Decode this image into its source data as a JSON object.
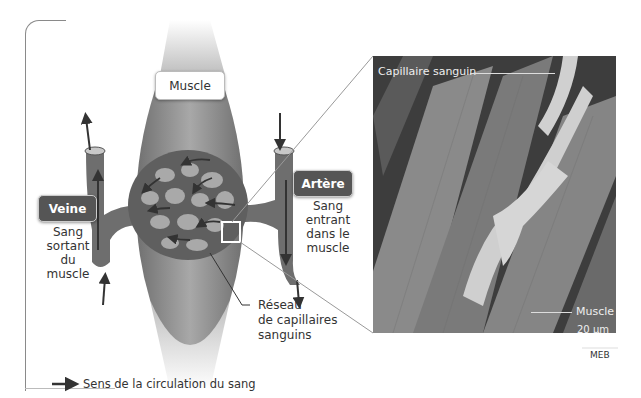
{
  "diagram": {
    "muscle_label": "Muscle",
    "vein": {
      "title": "Veine",
      "description_lines": [
        "Sang",
        "sortant",
        "du muscle"
      ]
    },
    "artery": {
      "title": "Artère",
      "description_lines": [
        "Sang",
        "entrant",
        "dans le",
        "muscle"
      ]
    },
    "network_label_lines": [
      "Réseau",
      "de capillaires",
      "sanguins"
    ],
    "legend": {
      "icon": "arrow-right-icon",
      "text": "Sens de la circulation du sang"
    }
  },
  "micrograph": {
    "capillary_label": "Capillaire sanguin",
    "muscle_label": "Muscle",
    "scale_value": "20 µm",
    "technique": "MEB"
  },
  "colors": {
    "muscle": "#8c8c8c",
    "vessel": "#6e6e6e",
    "label_dark": "#555555",
    "arrow": "#333333",
    "photo_bg": "#3d3d3d"
  }
}
